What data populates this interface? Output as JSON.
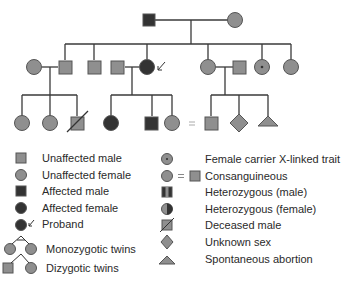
{
  "colors": {
    "unaffected": "#8f8f8f",
    "affected": "#333333",
    "line": "#3a3a3a",
    "stroke": "#555555",
    "background": "#ffffff"
  },
  "pedigree": {
    "generation1": [
      {
        "id": "g1-father",
        "sex": "male",
        "status": "affected"
      },
      {
        "id": "g1-mother",
        "sex": "female",
        "status": "unaffected"
      }
    ],
    "generation2": [
      {
        "id": "g2-spouse-female",
        "sex": "female",
        "status": "unaffected"
      },
      {
        "id": "g2-son-1",
        "sex": "male",
        "status": "unaffected"
      },
      {
        "id": "g2-son-2",
        "sex": "male",
        "status": "unaffected"
      },
      {
        "id": "g2-spouse-male",
        "sex": "male",
        "status": "unaffected"
      },
      {
        "id": "g2-daughter-proband",
        "sex": "female",
        "status": "affected",
        "proband": true
      },
      {
        "id": "g2-daughter-2",
        "sex": "female",
        "status": "unaffected"
      },
      {
        "id": "g2-spouse-male-2",
        "sex": "male",
        "status": "unaffected"
      },
      {
        "id": "g2-daughter-carrier",
        "sex": "female",
        "status": "carrier"
      },
      {
        "id": "g2-daughter-4",
        "sex": "female",
        "status": "unaffected"
      }
    ],
    "generation3": [
      {
        "id": "g3-a1",
        "sex": "female",
        "status": "unaffected"
      },
      {
        "id": "g3-a2",
        "sex": "female",
        "status": "unaffected"
      },
      {
        "id": "g3-a3",
        "sex": "male",
        "status": "deceased"
      },
      {
        "id": "g3-b1",
        "sex": "female",
        "status": "affected"
      },
      {
        "id": "g3-b2",
        "sex": "male",
        "status": "affected"
      },
      {
        "id": "g3-b3",
        "sex": "female",
        "status": "unaffected",
        "consanguineous": true
      },
      {
        "id": "g3-c1",
        "sex": "male",
        "status": "unaffected",
        "consanguineous": true
      },
      {
        "id": "g3-c2",
        "sex": "unknown",
        "status": "unaffected"
      },
      {
        "id": "g3-c3",
        "sex": "abortion",
        "status": "unaffected"
      }
    ],
    "consanguinity_mark": "="
  },
  "legend": {
    "left": [
      {
        "icon": "unaffected-male-icon",
        "label": "Unaffected male"
      },
      {
        "icon": "unaffected-female-icon",
        "label": "Unaffected female"
      },
      {
        "icon": "affected-male-icon",
        "label": "Affected male"
      },
      {
        "icon": "affected-female-icon",
        "label": "Affected female"
      },
      {
        "icon": "proband-icon",
        "label": "Proband"
      },
      {
        "icon": "monozygotic-twins-icon",
        "label": "Monozygotic twins"
      },
      {
        "icon": "dizygotic-twins-icon",
        "label": "Dizygotic twins"
      }
    ],
    "right": [
      {
        "icon": "female-carrier-icon",
        "label": "Female carrier X-linked trait"
      },
      {
        "icon": "consanguineous-icon",
        "label": "Consanguineous",
        "mark": "="
      },
      {
        "icon": "heterozygous-male-icon",
        "label": "Heterozygous (male)"
      },
      {
        "icon": "heterozygous-female-icon",
        "label": "Heterozygous (female)"
      },
      {
        "icon": "deceased-male-icon",
        "label": "Deceased male"
      },
      {
        "icon": "unknown-sex-icon",
        "label": "Unknown sex"
      },
      {
        "icon": "spontaneous-abortion-icon",
        "label": "Spontaneous abortion"
      }
    ]
  }
}
